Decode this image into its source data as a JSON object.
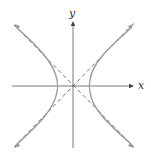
{
  "diagram": {
    "axes": {
      "x_label": "x",
      "y_label": "y"
    },
    "colors": {
      "axis": "#555555",
      "curve": "#999999",
      "asymptote": "#555555",
      "background": "#ffffff"
    },
    "curve": {
      "type": "hyperbola",
      "opening": "horizontal",
      "vertices": [
        "left",
        "right"
      ],
      "asymptotes": "dashed lines through origin"
    }
  }
}
